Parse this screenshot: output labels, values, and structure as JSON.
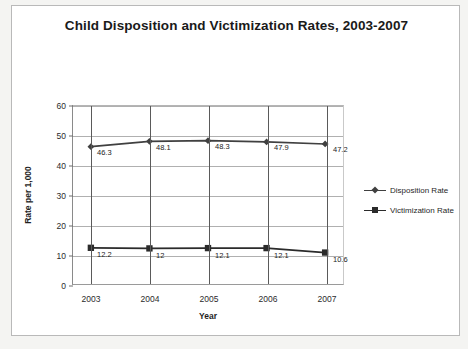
{
  "document": {
    "border_color": "#b9b9b9",
    "page_background": "#f4f4f2"
  },
  "chart_data": {
    "type": "line",
    "title": "Child Disposition and Victimization Rates, 2003-2007",
    "xlabel": "Year",
    "ylabel": "Rate per 1,000",
    "categories": [
      "2003",
      "2004",
      "2005",
      "2006",
      "2007"
    ],
    "ylim": [
      0,
      60
    ],
    "yticks": [
      0,
      10,
      20,
      30,
      40,
      50,
      60
    ],
    "ytick_labels": [
      "0",
      "10",
      "20",
      "30",
      "40",
      "50",
      "60"
    ],
    "grid": true,
    "legend_position": "right",
    "series": [
      {
        "name": "Disposition Rate",
        "marker": "diamond",
        "color": "#404040",
        "values": [
          46.3,
          48.1,
          48.3,
          47.9,
          47.2
        ],
        "labels": [
          "46.3",
          "48.1",
          "48.3",
          "47.9",
          "47.2"
        ]
      },
      {
        "name": "Victimization Rate",
        "marker": "square",
        "color": "#2b2b2b",
        "values": [
          12.2,
          12,
          12.1,
          12.1,
          10.6
        ],
        "labels": [
          "12.2",
          "12",
          "12.1",
          "12.1",
          "10.6"
        ]
      }
    ]
  }
}
